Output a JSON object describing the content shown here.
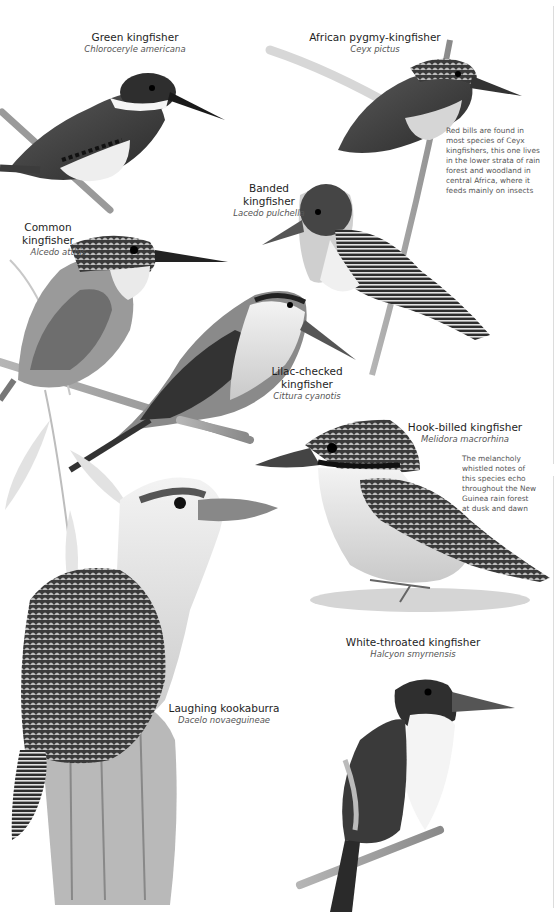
{
  "page": {
    "background": "#ffffff",
    "ink_color": "#2a2a2a"
  },
  "species": [
    {
      "id": "green-kingfisher",
      "common_name": "Green kingfisher",
      "scientific_name": "Chloroceryle americana"
    },
    {
      "id": "african-pygmy-kingfisher",
      "common_name": "African pygmy-kingfisher",
      "scientific_name": "Ceyx pictus",
      "note_lines": [
        "Red bills are found in",
        "most species of Ceyx",
        "kingfishers, this one lives",
        "in the lower strata of rain",
        "forest and woodland in",
        "central Africa, where it",
        "feeds mainly on insects"
      ]
    },
    {
      "id": "banded-kingfisher",
      "common_name_lines": [
        "Banded",
        "kingfisher"
      ],
      "scientific_name": "Lacedo pulchella"
    },
    {
      "id": "common-kingfisher",
      "common_name": "Common kingfisher",
      "scientific_name": "Alcedo atthis"
    },
    {
      "id": "lilac-checked-kingfisher",
      "common_name_lines": [
        "Lilac-checked",
        "kingfisher"
      ],
      "scientific_name": "Cittura cyanotis"
    },
    {
      "id": "hook-billed-kingfisher",
      "common_name": "Hook-billed kingfisher",
      "scientific_name": "Melidora macrorhina",
      "note_lines": [
        "The melancholy",
        "whistled notes of",
        "this species echo",
        "throughout the New",
        "Guinea rain forest",
        "at dusk and dawn"
      ]
    },
    {
      "id": "white-throated-kingfisher",
      "common_name": "White-throated kingfisher",
      "scientific_name": "Halcyon smyrnensis"
    },
    {
      "id": "laughing-kookaburra",
      "common_name": "Laughing kookaburra",
      "scientific_name": "Dacelo novaeguineae"
    }
  ]
}
